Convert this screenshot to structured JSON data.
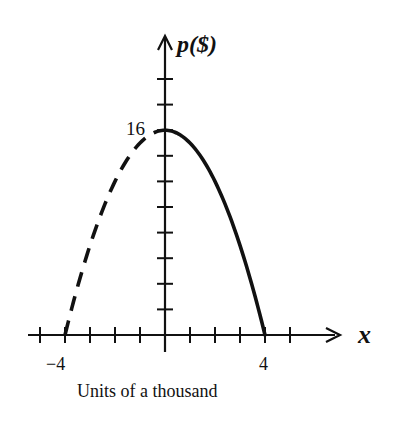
{
  "chart_data": {
    "type": "line",
    "title": "",
    "xlabel": "x",
    "ylabel": "p($)",
    "caption": "Units of a thousand",
    "x_tick_labels": [
      {
        "value": -4,
        "label": "−4"
      },
      {
        "value": 4,
        "label": "4"
      }
    ],
    "y_tick_labels": [
      {
        "value": 16,
        "label": "16"
      }
    ],
    "x_ticks": [
      -5,
      -4,
      -3,
      -2,
      -1,
      1,
      2,
      3,
      4,
      5
    ],
    "y_ticks": [
      2,
      4,
      6,
      8,
      10,
      12,
      14,
      16,
      18,
      20
    ],
    "xlim": [
      -5.4,
      7
    ],
    "ylim": [
      0,
      22
    ],
    "grid": false,
    "legend": null,
    "series": [
      {
        "name": "p = 16 - x^2 (x >= 0)",
        "style": "solid",
        "equation": "16 - x^2",
        "x": [
          0,
          1,
          2,
          3,
          4
        ],
        "y": [
          16,
          15,
          12,
          7,
          0
        ]
      },
      {
        "name": "p = 16 - x^2 (x < 0)",
        "style": "dashed",
        "equation": "16 - x^2",
        "x": [
          -4,
          -3,
          -2,
          -1,
          0
        ],
        "y": [
          0,
          7,
          12,
          15,
          16
        ]
      }
    ]
  },
  "labels": {
    "y_axis": "p($)",
    "x_axis": "x",
    "y16": "16",
    "xneg4": "−4",
    "xpos4": "4",
    "caption": "Units of a thousand"
  },
  "colors": {
    "ink": "#111111",
    "background": "#ffffff"
  }
}
